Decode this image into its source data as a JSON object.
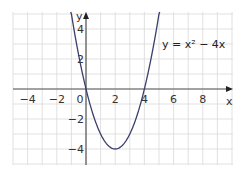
{
  "chart_data": {
    "type": "line",
    "title": "",
    "xlabel": "x",
    "ylabel": "y",
    "xlim": [
      -5,
      10
    ],
    "ylim": [
      -5,
      5
    ],
    "grid": true,
    "x_ticks": [
      -4,
      -2,
      0,
      2,
      4,
      6,
      8
    ],
    "y_ticks": [
      -4,
      -2,
      2,
      4
    ],
    "x_tick_labels": [
      "−4",
      "−2",
      "0",
      "2",
      "4",
      "6",
      "8"
    ],
    "y_tick_labels": [
      "−4",
      "−2",
      "2",
      "4"
    ],
    "annotation": "y = x² − 4x",
    "series": [
      {
        "name": "y = x² − 4x",
        "color": "#3a3f6b",
        "function": "x^2 - 4x",
        "x": [
          -1,
          -0.5,
          0,
          0.5,
          1,
          1.5,
          2,
          2.5,
          3,
          3.5,
          4,
          4.5,
          5
        ],
        "y": [
          5,
          2.25,
          0,
          -1.75,
          -3,
          -3.75,
          -4,
          -3.75,
          -3,
          -1.75,
          0,
          2.25,
          5
        ]
      }
    ],
    "key_points": {
      "vertex": [
        2,
        -4
      ],
      "roots": [
        [
          0,
          0
        ],
        [
          4,
          0
        ]
      ]
    }
  },
  "labels": {
    "x_axis": "x",
    "y_axis": "y",
    "equation": "y = x² − 4x",
    "origin": "0"
  },
  "colors": {
    "grid": "#d9d9d9",
    "axis": "#555555",
    "curve": "#3a3f6b"
  }
}
